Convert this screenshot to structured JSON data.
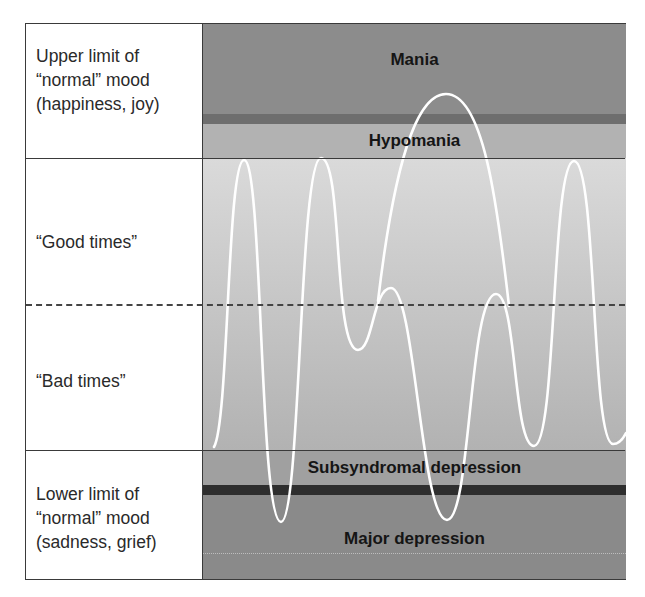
{
  "left_labels": {
    "upper_limit": [
      "Upper limit of",
      "“normal” mood",
      "(happiness, joy)"
    ],
    "good_times": "“Good times”",
    "bad_times": "“Bad times”",
    "lower_limit": [
      "Lower limit of",
      "“normal” mood",
      "(sadness, grief)"
    ]
  },
  "bands": {
    "mania": "Mania",
    "hypomania": "Hypomania",
    "subsyndromal": "Subsyndromal depression",
    "major": "Major depression"
  },
  "colors": {
    "mania": "#8c8c8c",
    "mania_stripe": "#6e6e6e",
    "hypomania": "#b2b2b2",
    "normal_top": "#d8d8d8",
    "normal_bottom": "#b4b4b4",
    "subsyndromal": "#9e9e9e",
    "depression_stripe": "#2e2e2e",
    "major": "#8a8a8a",
    "curve": "#ffffff"
  }
}
